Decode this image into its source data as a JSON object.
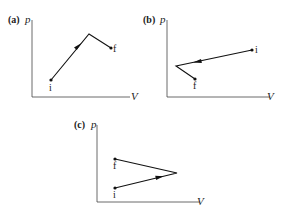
{
  "figure": {
    "panels": [
      {
        "id": "a",
        "label": "(a)",
        "y_axis_label": "p",
        "x_axis_label": "V",
        "origin": [
          32,
          97
        ],
        "y_top": 20,
        "x_right": 130,
        "points": {
          "i": {
            "label": "i",
            "x": 51,
            "y": 80,
            "label_dx": -1,
            "label_dy": 10
          },
          "f": {
            "label": "f",
            "x": 111,
            "y": 48,
            "label_dx": 2,
            "label_dy": 3
          }
        },
        "vertices": [
          [
            51,
            80
          ],
          [
            89,
            34
          ],
          [
            111,
            48
          ]
        ],
        "arrow": {
          "segment": 0,
          "position": 0.7,
          "direction": "forward"
        }
      },
      {
        "id": "b",
        "label": "(b)",
        "y_axis_label": "p",
        "x_axis_label": "V",
        "origin": [
          167,
          97
        ],
        "y_top": 20,
        "x_right": 270,
        "points": {
          "i": {
            "label": "i",
            "x": 252,
            "y": 50,
            "label_dx": 3,
            "label_dy": 3
          },
          "f": {
            "label": "f",
            "x": 195,
            "y": 79,
            "label_dx": -2,
            "label_dy": 10
          }
        },
        "vertices": [
          [
            252,
            50
          ],
          [
            176,
            66
          ],
          [
            195,
            79
          ]
        ],
        "arrow": {
          "segment": 0,
          "position": 0.8,
          "direction": "forward"
        }
      },
      {
        "id": "c",
        "label": "(c)",
        "y_axis_label": "p",
        "x_axis_label": "V",
        "origin": [
          97,
          202
        ],
        "y_top": 125,
        "x_right": 200,
        "points": {
          "i": {
            "label": "i",
            "x": 115,
            "y": 188,
            "label_dx": -2,
            "label_dy": 10
          },
          "f": {
            "label": "f",
            "x": 115,
            "y": 159,
            "label_dx": -2,
            "label_dy": 10
          }
        },
        "vertices": [
          [
            115,
            188
          ],
          [
            177,
            173
          ],
          [
            115,
            159
          ]
        ],
        "arrow": {
          "segment": 0,
          "position": 0.75,
          "direction": "forward"
        }
      }
    ]
  }
}
